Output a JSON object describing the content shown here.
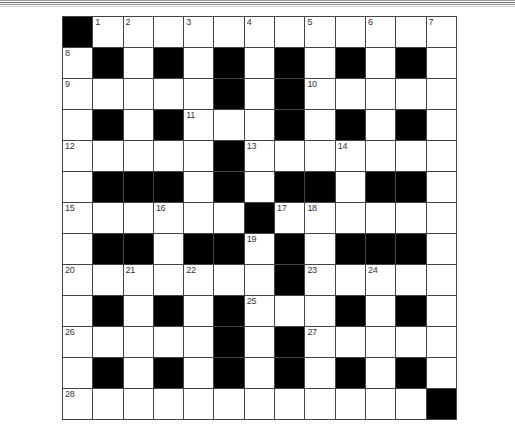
{
  "puzzle": {
    "rows": 13,
    "cols": 13,
    "colors": {
      "block": "#000000",
      "cell": "#ffffff",
      "border": "#444444",
      "number": "#333333"
    },
    "layout": [
      "#............",
      ".#.#.#.#.#.#.",
      ".....#.#.....",
      ".#.#...#.#.#.",
      ".....#.......",
      ".###.#.##.##.",
      "......#......",
      ".##.##.#.###.",
      ".......#.....",
      ".#.#.#...#.#.",
      ".....#.#.....",
      ".#.#.#.#.#.#.",
      "............#"
    ],
    "numbers": [
      {
        "row": 0,
        "col": 1,
        "n": "1"
      },
      {
        "row": 0,
        "col": 2,
        "n": "2"
      },
      {
        "row": 0,
        "col": 4,
        "n": "3"
      },
      {
        "row": 0,
        "col": 6,
        "n": "4"
      },
      {
        "row": 0,
        "col": 8,
        "n": "5"
      },
      {
        "row": 0,
        "col": 10,
        "n": "6"
      },
      {
        "row": 0,
        "col": 12,
        "n": "7"
      },
      {
        "row": 1,
        "col": 0,
        "n": "8"
      },
      {
        "row": 2,
        "col": 0,
        "n": "9"
      },
      {
        "row": 2,
        "col": 8,
        "n": "10"
      },
      {
        "row": 3,
        "col": 4,
        "n": "11"
      },
      {
        "row": 4,
        "col": 0,
        "n": "12"
      },
      {
        "row": 4,
        "col": 6,
        "n": "13"
      },
      {
        "row": 4,
        "col": 9,
        "n": "14"
      },
      {
        "row": 6,
        "col": 0,
        "n": "15"
      },
      {
        "row": 6,
        "col": 3,
        "n": "16"
      },
      {
        "row": 6,
        "col": 7,
        "n": "17"
      },
      {
        "row": 6,
        "col": 8,
        "n": "18"
      },
      {
        "row": 7,
        "col": 6,
        "n": "19"
      },
      {
        "row": 8,
        "col": 0,
        "n": "20"
      },
      {
        "row": 8,
        "col": 2,
        "n": "21"
      },
      {
        "row": 8,
        "col": 4,
        "n": "22"
      },
      {
        "row": 8,
        "col": 8,
        "n": "23"
      },
      {
        "row": 8,
        "col": 10,
        "n": "24"
      },
      {
        "row": 9,
        "col": 6,
        "n": "25"
      },
      {
        "row": 10,
        "col": 0,
        "n": "26"
      },
      {
        "row": 10,
        "col": 8,
        "n": "27"
      },
      {
        "row": 12,
        "col": 0,
        "n": "28"
      }
    ],
    "entries": {}
  }
}
